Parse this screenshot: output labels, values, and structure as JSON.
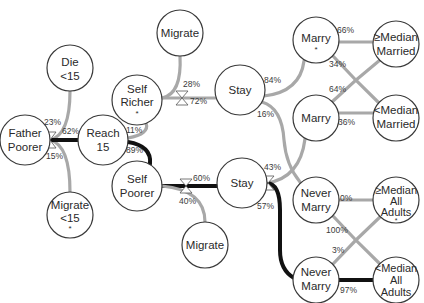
{
  "colors": {
    "node_stroke": "#3a3a3a",
    "edge_light": "#a8a8a8",
    "edge_dark": "#111111",
    "background": "#ffffff"
  },
  "nodes": {
    "die15": {
      "lines": [
        "Die",
        "<15"
      ]
    },
    "father": {
      "lines": [
        "Father",
        "Poorer"
      ]
    },
    "reach15": {
      "lines": [
        "Reach",
        "15"
      ]
    },
    "migrate15": {
      "lines": [
        "Migrate",
        "<15",
        "*"
      ]
    },
    "migrateTop": {
      "lines": [
        "Migrate"
      ]
    },
    "selfRicher": {
      "lines": [
        "Self",
        "Richer",
        "*"
      ]
    },
    "stayTop": {
      "lines": [
        "Stay"
      ]
    },
    "selfPoorer": {
      "lines": [
        "Self",
        "Poorer"
      ]
    },
    "stayMid": {
      "lines": [
        "Stay"
      ]
    },
    "migrateBot": {
      "lines": [
        "Migrate"
      ]
    },
    "marryStar": {
      "lines": [
        "Marry",
        "*"
      ]
    },
    "marry": {
      "lines": [
        "Marry"
      ]
    },
    "neverMarryTop": {
      "lines": [
        "Never",
        "Marry"
      ]
    },
    "neverMarryBot": {
      "lines": [
        "Never",
        "Marry"
      ]
    },
    "geMedMarried": {
      "lines": [
        "≥Median",
        "Married"
      ]
    },
    "ltMedMarried": {
      "lines": [
        "<Median",
        "Married"
      ]
    },
    "geMedAll": {
      "lines": [
        "≥Median",
        "All",
        "Adults",
        "*"
      ]
    },
    "ltMedAll": {
      "lines": [
        "<Median",
        "All",
        "Adults"
      ]
    }
  },
  "edges": {
    "father_die": "23%",
    "father_reach": "62%",
    "father_migrate": "15%",
    "reach_richer": "11%",
    "reach_poorer": "89%",
    "richer_migrate": "28%",
    "richer_stay": "72%",
    "poorer_stay": "60%",
    "poorer_migrate": "40%",
    "stayTop_marry": "84%",
    "stayTop_never": "16%",
    "stayMid_marry": "43%",
    "stayMid_never": "57%",
    "marryStar_ge": "66%",
    "marryStar_lt": "34%",
    "marry_ge": "64%",
    "marry_lt": "36%",
    "neverTop_ge": "0%",
    "neverTop_lt": "100%",
    "neverBot_ge": "3%",
    "neverBot_lt": "97%"
  }
}
